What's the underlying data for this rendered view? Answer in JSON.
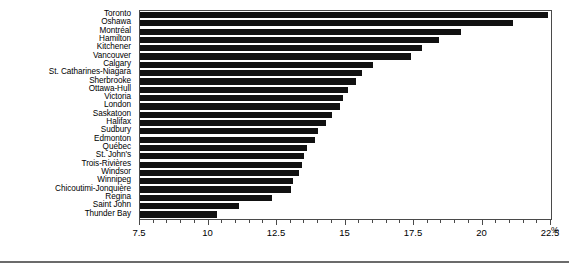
{
  "chart_data": {
    "type": "bar",
    "orientation": "horizontal",
    "title": "",
    "subtitle": "",
    "xlabel": "%",
    "ylabel": "",
    "xlim": [
      7.5,
      22.5
    ],
    "xticks": [
      7.5,
      10,
      12.5,
      15,
      17.5,
      20,
      22.5
    ],
    "xtick_labels": [
      "7.5",
      "10",
      "12.5",
      "15",
      "17.5",
      "20",
      "22.5"
    ],
    "minor_tick_interval": 0.5,
    "grid": false,
    "legend": null,
    "bar_color": "#111111",
    "frame_color": "#4a4a4a",
    "categories": [
      "Toronto",
      "Oshawa",
      "Montréal",
      "Hamilton",
      "Kitchener",
      "Vancouver",
      "Calgary",
      "St. Catharines-Niagara",
      "Sherbrooke",
      "Ottawa-Hull",
      "Victoria",
      "London",
      "Saskatoon",
      "Halifax",
      "Sudbury",
      "Edmonton",
      "Québec",
      "St. John's",
      "Trois-Rivières",
      "Windsor",
      "Winnipeg",
      "Chicoutimi-Jonquière",
      "Regina",
      "Saint John",
      "Thunder Bay"
    ],
    "values": [
      22.4,
      21.1,
      19.2,
      18.4,
      17.8,
      17.4,
      16.0,
      15.6,
      15.4,
      15.1,
      14.9,
      14.8,
      14.5,
      14.3,
      14.0,
      13.9,
      13.6,
      13.5,
      13.4,
      13.3,
      13.1,
      13.0,
      12.3,
      11.1,
      10.3
    ]
  },
  "axis": {
    "unit_label": "%"
  }
}
